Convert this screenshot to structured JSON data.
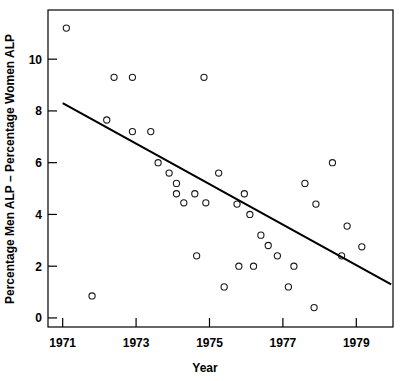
{
  "chart_data": {
    "type": "scatter",
    "title": "",
    "xlabel": "Year",
    "ylabel": "Percentage Men ALP – Percentage Women ALP",
    "xlim": [
      1970.6,
      1980.0
    ],
    "ylim": [
      -0.35,
      11.9
    ],
    "grid": false,
    "legend": null,
    "xticks": [
      1971,
      1973,
      1975,
      1977,
      1979
    ],
    "xtick_labels": [
      "1971",
      "1973",
      "1975",
      "1977",
      "1979"
    ],
    "yticks": [
      0,
      2,
      4,
      6,
      8,
      10
    ],
    "ytick_labels": [
      "0",
      "2",
      "4",
      "6",
      "8",
      "10"
    ],
    "marker": "open-circle",
    "marker_color": "#1a1a1a",
    "points": [
      {
        "x": 1971.1,
        "y": 11.2
      },
      {
        "x": 1971.8,
        "y": 0.85
      },
      {
        "x": 1972.2,
        "y": 7.65
      },
      {
        "x": 1972.4,
        "y": 9.3
      },
      {
        "x": 1972.9,
        "y": 9.3
      },
      {
        "x": 1972.9,
        "y": 7.2
      },
      {
        "x": 1973.4,
        "y": 7.2
      },
      {
        "x": 1973.6,
        "y": 6.0
      },
      {
        "x": 1973.9,
        "y": 5.6
      },
      {
        "x": 1974.1,
        "y": 5.2
      },
      {
        "x": 1974.1,
        "y": 4.8
      },
      {
        "x": 1974.3,
        "y": 4.45
      },
      {
        "x": 1974.6,
        "y": 4.8
      },
      {
        "x": 1974.65,
        "y": 2.4
      },
      {
        "x": 1974.85,
        "y": 9.3
      },
      {
        "x": 1974.9,
        "y": 4.45
      },
      {
        "x": 1975.25,
        "y": 5.6
      },
      {
        "x": 1975.4,
        "y": 1.2
      },
      {
        "x": 1975.75,
        "y": 4.4
      },
      {
        "x": 1975.8,
        "y": 2.0
      },
      {
        "x": 1975.95,
        "y": 4.8
      },
      {
        "x": 1976.1,
        "y": 4.0
      },
      {
        "x": 1976.2,
        "y": 2.0
      },
      {
        "x": 1976.4,
        "y": 3.2
      },
      {
        "x": 1976.6,
        "y": 2.8
      },
      {
        "x": 1976.85,
        "y": 2.4
      },
      {
        "x": 1977.15,
        "y": 1.2
      },
      {
        "x": 1977.3,
        "y": 2.0
      },
      {
        "x": 1977.6,
        "y": 5.2
      },
      {
        "x": 1977.85,
        "y": 0.4
      },
      {
        "x": 1977.9,
        "y": 4.4
      },
      {
        "x": 1978.35,
        "y": 6.0
      },
      {
        "x": 1978.6,
        "y": 2.4
      },
      {
        "x": 1978.75,
        "y": 3.55
      },
      {
        "x": 1979.15,
        "y": 2.75
      }
    ],
    "trend_line": {
      "x_start": 1971.0,
      "y_start": 8.3,
      "x_end": 1979.95,
      "y_end": 1.3
    }
  }
}
